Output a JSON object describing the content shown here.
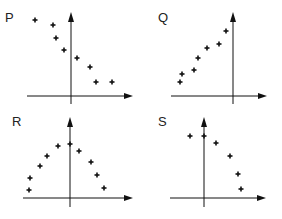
{
  "chart_data": [
    {
      "type": "scatter",
      "title": "P",
      "origin": [
        71,
        96
      ],
      "axis_x": [
        27,
        133
      ],
      "axis_y": [
        12,
        104
      ],
      "points": [
        [
          35,
          20
        ],
        [
          53,
          25
        ],
        [
          56,
          38
        ],
        [
          64,
          50
        ],
        [
          77,
          58
        ],
        [
          90,
          67
        ],
        [
          96,
          82
        ],
        [
          112,
          82
        ]
      ],
      "trend": "negative"
    },
    {
      "type": "scatter",
      "title": "Q",
      "origin": [
        233,
        96
      ],
      "axis_x": [
        171,
        267
      ],
      "axis_y": [
        12,
        104
      ],
      "points": [
        [
          180,
          82
        ],
        [
          182,
          74
        ],
        [
          194,
          70
        ],
        [
          198,
          58
        ],
        [
          207,
          48
        ],
        [
          219,
          44
        ],
        [
          226,
          31
        ]
      ],
      "trend": "positive"
    },
    {
      "type": "scatter",
      "title": "R",
      "origin": [
        70,
        198
      ],
      "axis_x": [
        23,
        133
      ],
      "axis_y": [
        117,
        207
      ],
      "points": [
        [
          29,
          190
        ],
        [
          30,
          178
        ],
        [
          40,
          166
        ],
        [
          47,
          156
        ],
        [
          58,
          146
        ],
        [
          70,
          144
        ],
        [
          79,
          151
        ],
        [
          91,
          162
        ],
        [
          97,
          175
        ],
        [
          104,
          188
        ]
      ],
      "trend": "inverted-u"
    },
    {
      "type": "scatter",
      "title": "S",
      "origin": [
        204,
        198
      ],
      "axis_x": [
        170,
        266
      ],
      "axis_y": [
        117,
        207
      ],
      "points": [
        [
          190,
          136
        ],
        [
          204,
          136
        ],
        [
          216,
          143
        ],
        [
          230,
          156
        ],
        [
          238,
          174
        ],
        [
          241,
          189
        ]
      ],
      "trend": "negative"
    }
  ],
  "labels": {
    "p": "P",
    "q": "Q",
    "r": "R",
    "s": "S"
  }
}
